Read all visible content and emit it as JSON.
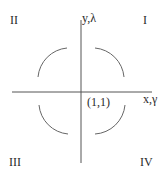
{
  "diagram": {
    "quadrants": {
      "q1": "I",
      "q2": "II",
      "q3": "III",
      "q4": "IV"
    },
    "axes": {
      "vertical_label": "y,λ",
      "horizontal_label": "x,γ"
    },
    "point_label": "(1,1)",
    "colors": {
      "stroke": "#555555",
      "text": "#2a2a2a",
      "background": "#ffffff"
    }
  }
}
